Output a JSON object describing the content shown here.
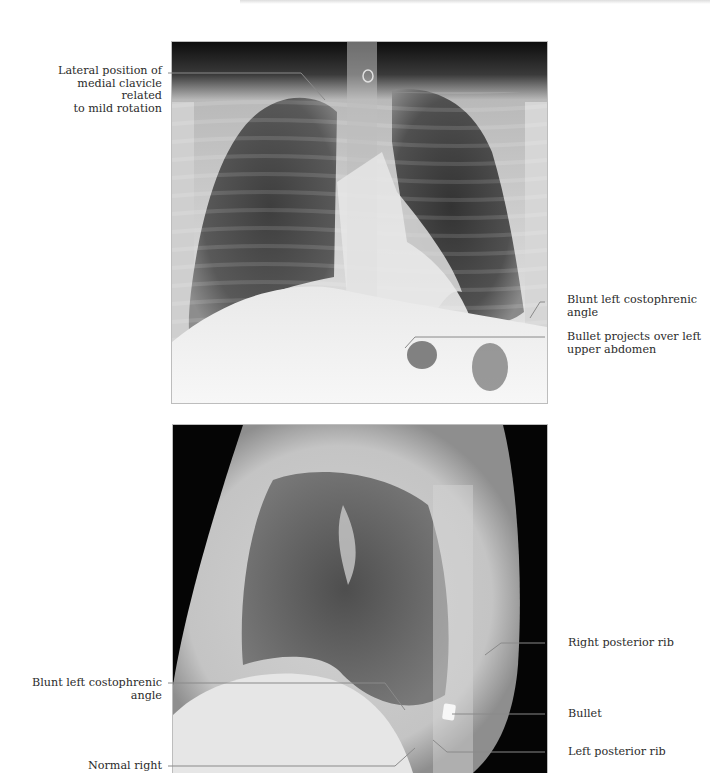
{
  "page": {
    "header_text": "",
    "figures": [
      {
        "id": "pa",
        "view": "frontal chest radiograph",
        "labels": [
          {
            "id": "clavicle",
            "text": "Lateral position of medial clavicle related to mild rotation",
            "lines": [
              "Lateral position of",
              "medial clavicle related",
              "to mild rotation"
            ],
            "side": "left"
          },
          {
            "id": "blunt-angle-pa",
            "text": "Blunt left costophrenic angle",
            "lines": [
              "Blunt left costophrenic",
              "angle"
            ],
            "side": "right"
          },
          {
            "id": "bullet-abdomen",
            "text": "Bullet projects over left upper abdomen",
            "lines": [
              "Bullet projects over left",
              "upper abdomen"
            ],
            "side": "right"
          }
        ]
      },
      {
        "id": "lateral",
        "view": "lateral chest radiograph",
        "labels": [
          {
            "id": "right-posterior-rib",
            "text": "Right posterior rib",
            "lines": [
              "Right posterior rib"
            ],
            "side": "right"
          },
          {
            "id": "blunt-angle-lat",
            "text": "Blunt left costophrenic angle",
            "lines": [
              "Blunt left costophrenic",
              "angle"
            ],
            "side": "left"
          },
          {
            "id": "bullet",
            "text": "Bullet",
            "lines": [
              "Bullet"
            ],
            "side": "right"
          },
          {
            "id": "left-posterior-rib",
            "text": "Left posterior rib",
            "lines": [
              "Left posterior rib"
            ],
            "side": "right"
          },
          {
            "id": "normal-right",
            "text": "Normal right",
            "lines": [
              "Normal right"
            ],
            "side": "left"
          }
        ]
      }
    ]
  },
  "colors": {
    "background": "#ffffff",
    "text": "#2b2b2b",
    "leader_line": "#8a8a8a",
    "film_dark": "#0a0a0a",
    "film_light": "#f2f2f2"
  }
}
